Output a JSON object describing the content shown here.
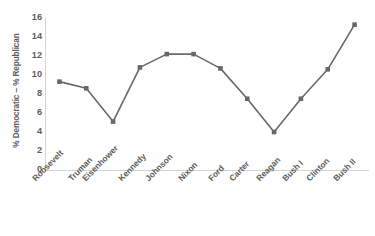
{
  "chart_data": {
    "type": "line",
    "title": "",
    "xlabel": "",
    "ylabel": "% Democratic – % Republican",
    "categories": [
      "Roosevelt",
      "Truman",
      "Eisenhower",
      "Kennedy",
      "Johnson",
      "Nixon",
      "Ford",
      "Carter",
      "Reagan",
      "Bush I",
      "Clinton",
      "Bush II"
    ],
    "values": [
      9.3,
      8.6,
      5.1,
      10.8,
      12.2,
      12.2,
      10.7,
      7.5,
      4.0,
      7.5,
      10.6,
      15.3
    ],
    "ylim": [
      0,
      16
    ],
    "yticks": [
      0,
      2,
      4,
      6,
      8,
      10,
      12,
      14,
      16
    ],
    "ytick_labels": [
      "0",
      "2",
      "4",
      "6",
      "8",
      "10",
      "12",
      "14",
      "16"
    ],
    "grid": false,
    "legend": "none",
    "series_color": "#686868",
    "marker": "square",
    "axis_color": "#d4d4d4",
    "text_color": "#5d5d5d"
  }
}
